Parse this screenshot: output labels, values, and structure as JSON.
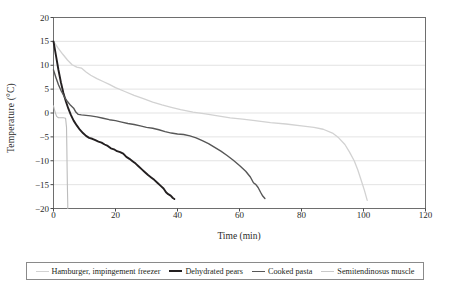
{
  "chart_data": {
    "type": "line",
    "title": "",
    "xlabel": "Time (min)",
    "ylabel": "Temperature (°C)",
    "xlim": [
      0,
      120
    ],
    "ylim": [
      -20,
      20
    ],
    "xticks": [
      0,
      20,
      40,
      60,
      80,
      100,
      120
    ],
    "yticks": [
      -20,
      -15,
      -10,
      -5,
      0,
      5,
      10,
      15,
      20
    ],
    "grid": "horizontal",
    "legend_position": "bottom",
    "series": [
      {
        "name": "Hamburger, impingement freezer",
        "color": "#d2d2d2",
        "width": 1.3,
        "points": [
          [
            0,
            15.0
          ],
          [
            1.5,
            13.6
          ],
          [
            3,
            12.3
          ],
          [
            4.5,
            11.1
          ],
          [
            6,
            10.1
          ],
          [
            7.5,
            9.6
          ],
          [
            9,
            9.4
          ],
          [
            10.5,
            8.6
          ],
          [
            12,
            7.9
          ],
          [
            14,
            7.2
          ],
          [
            16,
            6.6
          ],
          [
            18,
            6.0
          ],
          [
            20,
            5.3
          ],
          [
            23,
            4.5
          ],
          [
            26,
            3.7
          ],
          [
            29,
            3.0
          ],
          [
            32,
            2.3
          ],
          [
            35,
            1.7
          ],
          [
            38,
            1.2
          ],
          [
            41,
            0.7
          ],
          [
            45,
            0.2
          ],
          [
            49,
            -0.2
          ],
          [
            53,
            -0.6
          ],
          [
            57,
            -1.0
          ],
          [
            61,
            -1.3
          ],
          [
            65,
            -1.6
          ],
          [
            70,
            -2.0
          ],
          [
            75,
            -2.3
          ],
          [
            80,
            -2.7
          ],
          [
            84,
            -3.0
          ],
          [
            87,
            -3.4
          ],
          [
            90,
            -4.2
          ],
          [
            92,
            -5.2
          ],
          [
            94,
            -6.6
          ],
          [
            95.5,
            -8.2
          ],
          [
            97,
            -10.0
          ],
          [
            98.2,
            -12.0
          ],
          [
            99.3,
            -14.2
          ],
          [
            100.3,
            -16.2
          ],
          [
            101.2,
            -18.3
          ]
        ]
      },
      {
        "name": "Dehydrated pears",
        "color": "#231f20",
        "width": 1.9,
        "points": [
          [
            0,
            15.0
          ],
          [
            0.8,
            12.0
          ],
          [
            1.6,
            9.0
          ],
          [
            2.4,
            6.4
          ],
          [
            3.2,
            4.2
          ],
          [
            4.0,
            2.4
          ],
          [
            4.8,
            0.9
          ],
          [
            5.6,
            -0.4
          ],
          [
            6.5,
            -1.6
          ],
          [
            7.5,
            -2.6
          ],
          [
            8.5,
            -3.5
          ],
          [
            9.5,
            -4.2
          ],
          [
            10.5,
            -4.8
          ],
          [
            11.5,
            -5.2
          ],
          [
            12.5,
            -5.4
          ],
          [
            13.5,
            -5.7
          ],
          [
            14.5,
            -6.0
          ],
          [
            15.5,
            -6.2
          ],
          [
            16.5,
            -6.6
          ],
          [
            17.5,
            -6.9
          ],
          [
            18.5,
            -7.4
          ],
          [
            19.5,
            -7.6
          ],
          [
            20.5,
            -8.0
          ],
          [
            21.5,
            -8.2
          ],
          [
            22.5,
            -8.5
          ],
          [
            23.5,
            -9.2
          ],
          [
            24.5,
            -9.6
          ],
          [
            25.5,
            -10.1
          ],
          [
            26.5,
            -10.6
          ],
          [
            27.5,
            -11.2
          ],
          [
            28.5,
            -11.8
          ],
          [
            29.5,
            -12.4
          ],
          [
            30.5,
            -13.0
          ],
          [
            31.5,
            -13.5
          ],
          [
            32.5,
            -14.0
          ],
          [
            33.5,
            -14.6
          ],
          [
            34.5,
            -15.2
          ],
          [
            35.5,
            -15.8
          ],
          [
            36.3,
            -16.6
          ],
          [
            37.0,
            -17.0
          ],
          [
            37.8,
            -17.3
          ],
          [
            38.5,
            -17.8
          ],
          [
            39.0,
            -18.0
          ]
        ]
      },
      {
        "name": "Cooked pasta",
        "color": "#575757",
        "width": 1.4,
        "points": [
          [
            0,
            9.0
          ],
          [
            0.8,
            7.4
          ],
          [
            1.6,
            5.9
          ],
          [
            2.5,
            4.6
          ],
          [
            3.5,
            3.4
          ],
          [
            4.5,
            2.4
          ],
          [
            5.5,
            1.6
          ],
          [
            6.5,
            1.0
          ],
          [
            7.2,
            0.2
          ],
          [
            8.0,
            -0.3
          ],
          [
            9.0,
            -0.4
          ],
          [
            10.5,
            -0.5
          ],
          [
            12,
            -0.6
          ],
          [
            14,
            -0.8
          ],
          [
            16,
            -1.1
          ],
          [
            18,
            -1.4
          ],
          [
            20,
            -1.6
          ],
          [
            22,
            -1.9
          ],
          [
            24,
            -2.2
          ],
          [
            26,
            -2.4
          ],
          [
            28,
            -2.7
          ],
          [
            30,
            -3.0
          ],
          [
            32,
            -3.2
          ],
          [
            34,
            -3.5
          ],
          [
            36,
            -3.9
          ],
          [
            38,
            -4.2
          ],
          [
            40,
            -4.4
          ],
          [
            42,
            -4.5
          ],
          [
            44,
            -4.8
          ],
          [
            46,
            -5.2
          ],
          [
            48,
            -5.8
          ],
          [
            50,
            -6.4
          ],
          [
            52,
            -7.2
          ],
          [
            54,
            -8.0
          ],
          [
            56,
            -8.9
          ],
          [
            58,
            -9.9
          ],
          [
            60,
            -11.0
          ],
          [
            62,
            -12.2
          ],
          [
            63.5,
            -13.4
          ],
          [
            64.5,
            -14.6
          ],
          [
            65.3,
            -15.0
          ],
          [
            66.0,
            -15.6
          ],
          [
            66.8,
            -16.6
          ],
          [
            67.5,
            -17.4
          ],
          [
            68.2,
            -17.9
          ]
        ]
      },
      {
        "name": "Semitendinosus muscle",
        "color": "#bcbcbc",
        "width": 1.1,
        "points": [
          [
            0,
            1.5
          ],
          [
            0.5,
            0.2
          ],
          [
            1.0,
            -0.7
          ],
          [
            1.6,
            -1.0
          ],
          [
            2.4,
            -1.0
          ],
          [
            3.2,
            -1.0
          ],
          [
            3.9,
            -1.1
          ],
          [
            4.2,
            -3.0
          ],
          [
            4.3,
            -7.0
          ],
          [
            4.4,
            -12.0
          ],
          [
            4.5,
            -16.0
          ],
          [
            4.6,
            -19.0
          ],
          [
            4.6,
            -20.0
          ]
        ]
      }
    ]
  },
  "axes": {
    "ytick_labels": [
      "20",
      "15",
      "10",
      "5",
      "0",
      "−5",
      "−10",
      "−15",
      "−20"
    ],
    "xtick_labels": [
      "0",
      "20",
      "40",
      "60",
      "80",
      "100",
      "120"
    ],
    "ylabel": "Temperature (°C)",
    "xlabel": "Time (min)"
  },
  "legend": {
    "items": [
      {
        "label": "Hamburger, impingement freezer",
        "color": "#d2d2d2",
        "width": "1.4px"
      },
      {
        "label": "Dehydrated pears",
        "color": "#231f20",
        "width": "2.2px"
      },
      {
        "label": "Cooked pasta",
        "color": "#575757",
        "width": "1.6px"
      },
      {
        "label": "Semitendinosus muscle",
        "color": "#c9c9c9",
        "width": "1.2px"
      }
    ]
  }
}
